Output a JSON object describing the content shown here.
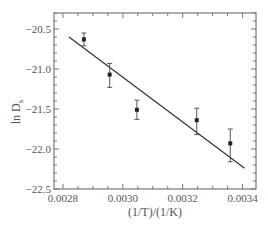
{
  "chart_data": {
    "type": "scatter",
    "title": "",
    "xlabel": "(1/T)/(1/K)",
    "ylabel": "ln D_s",
    "xlim": [
      0.00277,
      0.003445
    ],
    "ylim": [
      -22.5,
      -20.3
    ],
    "x_ticks": [
      0.0028,
      0.003,
      0.0032,
      0.0034
    ],
    "x_tick_labels": [
      "0.0028",
      "0.0030",
      "0.0032",
      "0.0034"
    ],
    "y_ticks": [
      -20.5,
      -21.0,
      -21.5,
      -22.0,
      -22.5
    ],
    "y_tick_labels": [
      "-20.5",
      "-21.0",
      "-21.5",
      "-22.0",
      "-22.5"
    ],
    "grid": false,
    "legend": null,
    "series": [
      {
        "name": "data",
        "marker": "square",
        "x": [
          0.00287,
          0.002956,
          0.003047,
          0.003247,
          0.003359
        ],
        "y": [
          -20.63,
          -21.07,
          -21.51,
          -21.64,
          -21.93
        ],
        "err_low": [
          -20.71,
          -21.23,
          -21.63,
          -21.82,
          -22.16
        ],
        "err_high": [
          -20.55,
          -20.93,
          -21.39,
          -21.49,
          -21.75
        ]
      },
      {
        "name": "linear fit",
        "type": "line",
        "x": [
          0.00282,
          0.003407
        ],
        "y": [
          -20.6,
          -22.24
        ]
      }
    ]
  },
  "labels": {
    "xlabel_display": "(1/T)/(1/K)",
    "ylabel_main": "ln D",
    "ylabel_sub": "s"
  },
  "colors": {
    "axis": "#777777",
    "marker": "#222222",
    "line": "#333333",
    "text": "#555555"
  }
}
